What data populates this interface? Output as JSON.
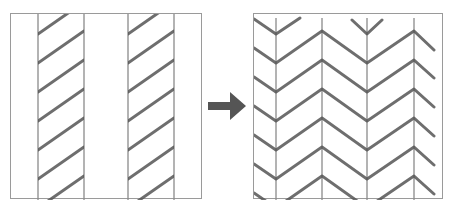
{
  "figure": {
    "caption": "",
    "before_panel": {
      "label": "Before: stripes of diagonal hatching",
      "stripes": [
        {
          "left_x": 37,
          "right_x": 83
        },
        {
          "left_x": 127,
          "right_x": 173
        }
      ]
    },
    "after_panel": {
      "label": "After: herringbone / chevron pattern",
      "vertical_lines_x": [
        275,
        321,
        366,
        413
      ]
    },
    "arrow": {
      "direction": "right",
      "color": "#555555"
    },
    "colors": {
      "border": "#9a9a9a",
      "vertical_line": "#8a8a8a",
      "stroke": "#555555"
    }
  }
}
